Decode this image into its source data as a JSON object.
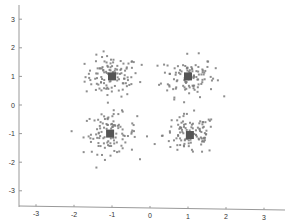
{
  "chart_data": {
    "type": "scatter",
    "title": "",
    "xlabel": "",
    "ylabel": "",
    "xlim": [
      -3.5,
      3.5
    ],
    "ylim": [
      -3.5,
      3.5
    ],
    "grid": false,
    "legend": null,
    "x_ticks": [
      "-3",
      "-2",
      "-1",
      "0",
      "1",
      "2",
      "3"
    ],
    "y_ticks": [
      "3",
      "2",
      "1",
      "0",
      "-1",
      "-2",
      "-3"
    ],
    "colors": {
      "points": "#7a7a7a",
      "centroid": "#555555",
      "axis": "#999999"
    },
    "series": [
      {
        "name": "cluster-1",
        "center": [
          -1.0,
          1.0
        ],
        "spread": 0.35,
        "n": 110
      },
      {
        "name": "cluster-2",
        "center": [
          1.0,
          1.0
        ],
        "spread": 0.35,
        "n": 110
      },
      {
        "name": "cluster-3",
        "center": [
          -1.05,
          -1.0
        ],
        "spread": 0.35,
        "n": 110
      },
      {
        "name": "cluster-4",
        "center": [
          1.05,
          -1.05
        ],
        "spread": 0.35,
        "n": 110
      }
    ],
    "centroids": [
      [
        -1.0,
        1.0
      ],
      [
        1.0,
        1.0
      ],
      [
        -1.05,
        -1.0
      ],
      [
        1.05,
        -1.05
      ]
    ]
  }
}
